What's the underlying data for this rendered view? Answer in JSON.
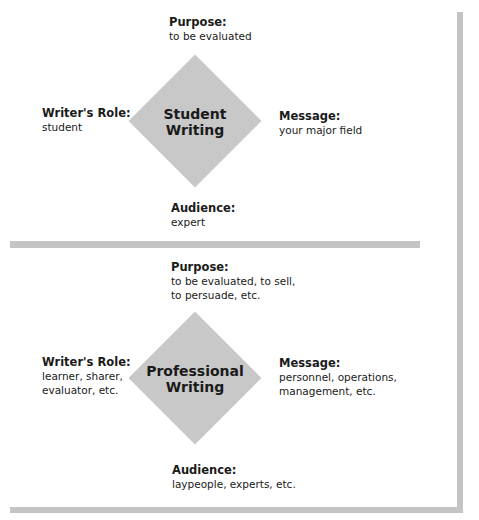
{
  "colors": {
    "bar": "#c4c4c4",
    "diamond": "#c8c8c8",
    "text": "#1a1a1a"
  },
  "student": {
    "center": [
      "Student",
      "Writing"
    ],
    "purpose": {
      "label": "Purpose:",
      "values": [
        "to be evaluated"
      ]
    },
    "role": {
      "label": "Writer's Role:",
      "values": [
        "student"
      ]
    },
    "message": {
      "label": "Message:",
      "values": [
        "your major field"
      ]
    },
    "audience": {
      "label": "Audience:",
      "values": [
        "expert"
      ]
    }
  },
  "professional": {
    "center": [
      "Professional",
      "Writing"
    ],
    "purpose": {
      "label": "Purpose:",
      "values": [
        "to be evaluated, to sell,",
        "to persuade, etc."
      ]
    },
    "role": {
      "label": "Writer's Role:",
      "values": [
        "learner, sharer,",
        "evaluator, etc."
      ]
    },
    "message": {
      "label": "Message:",
      "values": [
        "personnel, operations,",
        "management, etc."
      ]
    },
    "audience": {
      "label": "Audience:",
      "values": [
        "laypeople, experts, etc."
      ]
    }
  }
}
